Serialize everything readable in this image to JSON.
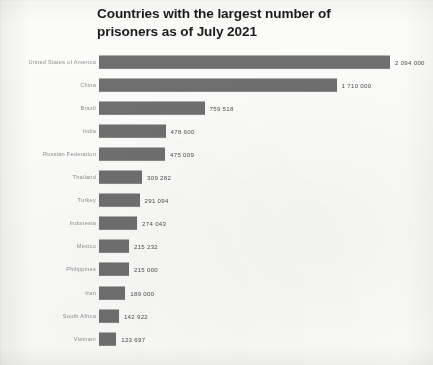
{
  "chart_data": {
    "type": "bar",
    "orientation": "horizontal",
    "title": "Countries with the largest number of\nprisoners as of July 2021",
    "xlabel": "",
    "ylabel": "",
    "grid": false,
    "legend": null,
    "xlim": [
      0,
      2094000
    ],
    "bar_color": "#6f6f6f",
    "categories": [
      "United States of America",
      "China",
      "Brazil",
      "India",
      "Russian Federation",
      "Thailand",
      "Turkey",
      "Indonesia",
      "Mexico",
      "Philippines",
      "Iran",
      "South Africa",
      "Vietnam"
    ],
    "values": [
      2094000,
      1710000,
      759518,
      478600,
      475009,
      309282,
      291094,
      274043,
      215232,
      215000,
      189000,
      142922,
      123697
    ],
    "value_labels": [
      "2 094 000",
      "1 710 000",
      "759 518",
      "478 600",
      "475 009",
      "309 282",
      "291 094",
      "274 043",
      "215 232",
      "215 000",
      "189 000",
      "142 922",
      "123 697"
    ]
  }
}
